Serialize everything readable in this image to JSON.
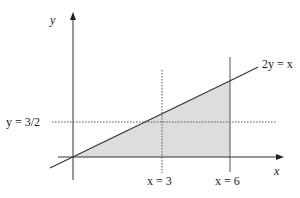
{
  "diagram": {
    "axes": {
      "x_label": "x",
      "y_label": "y"
    },
    "line": {
      "equation": "2y = x"
    },
    "guides": {
      "horizontal": "y = 3/2",
      "vertical_dotted": "x = 3",
      "vertical_solid": "x = 6"
    },
    "region": {
      "description": "shaded triangle between x-axis, line 2y = x, and x = 6"
    },
    "colors": {
      "stroke": "#333333",
      "fill": "#dddddd",
      "dotted": "#555555"
    }
  }
}
